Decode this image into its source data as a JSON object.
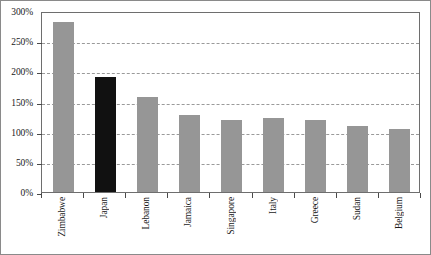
{
  "chart_data": {
    "type": "bar",
    "title": "",
    "subtitle": "",
    "xlabel": "",
    "ylabel": "",
    "categories": [
      "Zimbabwe",
      "Japan",
      "Lebanon",
      "Jamaica",
      "Singapore",
      "Italy",
      "Greece",
      "Sudan",
      "Belgium"
    ],
    "values": [
      281,
      190,
      157,
      128,
      120,
      122,
      120,
      109,
      104
    ],
    "value_labels": [
      "281%",
      "190%",
      "157%",
      "128%",
      "120%",
      "122%",
      "120%",
      "109%",
      "104%"
    ],
    "ylim": [
      0,
      300
    ],
    "ytick_values": [
      0,
      50,
      100,
      150,
      200,
      250,
      300
    ],
    "ytick_labels": [
      "0%",
      "50%",
      "100%",
      "150%",
      "200%",
      "250%",
      "300%"
    ],
    "grid": true,
    "grid_axis": "y",
    "grid_style": "dashed",
    "legend": false,
    "legend_position": "none",
    "bar_colors": [
      "#969696",
      "#111111",
      "#969696",
      "#969696",
      "#969696",
      "#969696",
      "#969696",
      "#969696",
      "#969696"
    ],
    "highlight_category": "Japan",
    "highlight_color": "#111111",
    "default_bar_color": "#969696",
    "plot_border_color": "#6e6e6e",
    "figure_border_color": "#8a8a8a",
    "background_color": "#ffffff",
    "gridline_color": "#9a9a9a",
    "text_color": "#1a1a1a"
  }
}
